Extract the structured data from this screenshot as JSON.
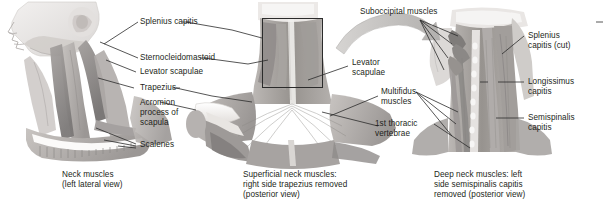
{
  "figure": {
    "background_color": "#ffffff",
    "text_color": "#231f20",
    "art_tone_light": "#e6e4e2",
    "art_tone_mid": "#b9b5b2",
    "art_tone_dark": "#8d8a88",
    "art_tone_darkest": "#6a6866",
    "arrow_color": "#bdbbb9",
    "leader_color": "#2b2b2b"
  },
  "panels": [
    {
      "id": "left",
      "caption_line_1": "Neck muscles",
      "caption_line_2": "(left lateral view)",
      "view": "left lateral view"
    },
    {
      "id": "middle",
      "caption_line_1": "Superficial neck muscles:",
      "caption_line_2": "right side trapezius removed",
      "caption_line_3": "(posterior view)",
      "view": "posterior view",
      "has_zoom_box": true
    },
    {
      "id": "right",
      "caption_line_1": "Deep neck muscles: left",
      "caption_line_2": "side semispinalis capitis",
      "caption_line_3": "removed (posterior view)",
      "view": "posterior view"
    }
  ],
  "labels": {
    "splenius_capitis": "Splenius capitis",
    "sternocleidomastoid": "Sternocleidomastoid",
    "levator_scapulae_left": "Levator scapulae",
    "trapezius": "Trapezius",
    "acromion_line_1": "Acromion",
    "acromion_line_2": "process of",
    "acromion_line_3": "scapula",
    "scalenes": "Scalenes",
    "levator_scapulae_mid_line_1": "Levator",
    "levator_scapulae_mid_line_2": "scapulae",
    "suboccipital_muscles": "Suboccipital muscles",
    "multifidus_line_1": "Multifidus",
    "multifidus_line_2": "muscles",
    "first_thoracic_line_1": "1st thoracic",
    "first_thoracic_line_2": "vertebrae",
    "splenius_capitis_cut_line_1": "Splenius",
    "splenius_capitis_cut_line_2": "capitis (cut)",
    "longissimus_line_1": "Longissimus",
    "longissimus_line_2": "capitis",
    "semispinalis_line_1": "Semispinalis",
    "semispinalis_line_2": "capitis"
  }
}
